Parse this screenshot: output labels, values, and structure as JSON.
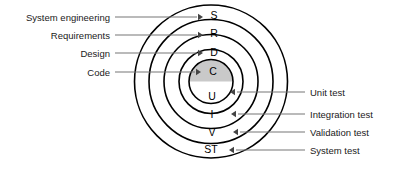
{
  "diagram": {
    "background_color": "#ffffff",
    "stroke_color": "#000000",
    "leader_color": "#777777",
    "shade_color": "#c9c9c9",
    "center": {
      "x": 211,
      "y": 81.5
    },
    "rings": [
      {
        "id": "system",
        "letter": "ST",
        "radius": 76.5,
        "letter_x": 211,
        "letter_y": 153,
        "phase_label": "System engineering",
        "test_label": "System test"
      },
      {
        "id": "requirements",
        "letter": "V",
        "radius": 62,
        "letter_x": 212,
        "letter_y": 136,
        "phase_label": "Requirements",
        "test_label": "Validation test"
      },
      {
        "id": "design",
        "letter": "I",
        "radius": 47,
        "letter_x": 212,
        "letter_y": 118,
        "phase_label": "Design",
        "test_label": "Integration test"
      },
      {
        "id": "code",
        "letter": "U",
        "radius": 32,
        "letter_x": 212,
        "letter_y": 100,
        "phase_label": "Code",
        "test_label": "Unit test"
      }
    ],
    "core": {
      "id": "core",
      "radius": 22,
      "shaded_half": "upper",
      "letter": "C",
      "letter_x": 213,
      "letter_y": 75
    },
    "ring_letters_top": [
      {
        "letter": "S",
        "x": 214,
        "y": 19
      },
      {
        "letter": "R",
        "x": 214,
        "y": 37
      },
      {
        "letter": "D",
        "x": 214,
        "y": 56
      }
    ],
    "left_labels": [
      {
        "text": "System engineering",
        "text_x": 110,
        "text_y": 21,
        "line_x1": 115,
        "line_x2": 197,
        "line_y": 17,
        "arrow_x": 203,
        "arrow_y": 17
      },
      {
        "text": "Requirements",
        "text_x": 110,
        "text_y": 39,
        "line_x1": 115,
        "line_x2": 197,
        "line_y": 35,
        "arrow_x": 203,
        "arrow_y": 35
      },
      {
        "text": "Design",
        "text_x": 110,
        "text_y": 57,
        "line_x1": 115,
        "line_x2": 197,
        "line_y": 53,
        "arrow_x": 203,
        "arrow_y": 53
      },
      {
        "text": "Code",
        "text_x": 110,
        "text_y": 76,
        "line_x1": 115,
        "line_x2": 195,
        "line_y": 72,
        "arrow_x": 201,
        "arrow_y": 72
      }
    ],
    "right_labels": [
      {
        "text": "Unit test",
        "text_x": 310,
        "text_y": 96,
        "line_x1": 305,
        "line_x2": 237,
        "line_y": 92,
        "arrow_x": 230,
        "arrow_y": 92
      },
      {
        "text": "Integration test",
        "text_x": 310,
        "text_y": 118,
        "line_x1": 305,
        "line_x2": 238,
        "line_y": 114,
        "arrow_x": 231,
        "arrow_y": 114
      },
      {
        "text": "Validation test",
        "text_x": 310,
        "text_y": 136,
        "line_x1": 305,
        "line_x2": 240,
        "line_y": 132,
        "arrow_x": 233,
        "arrow_y": 132
      },
      {
        "text": "System test",
        "text_x": 310,
        "text_y": 154,
        "line_x1": 305,
        "line_x2": 236,
        "line_y": 150,
        "arrow_x": 229,
        "arrow_y": 150
      }
    ]
  }
}
